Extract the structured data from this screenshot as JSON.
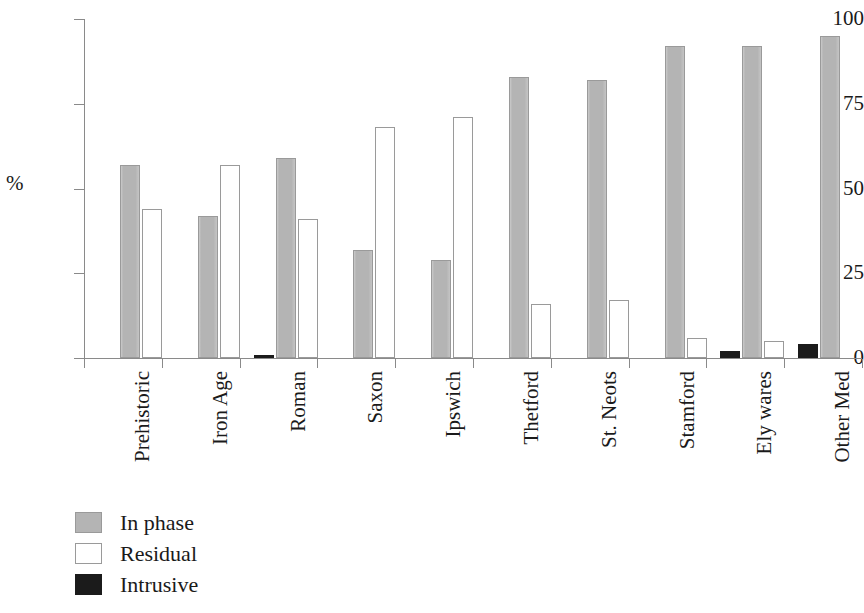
{
  "chart_data": {
    "type": "bar",
    "title": "",
    "xlabel": "",
    "ylabel": "%",
    "ylim": [
      0,
      100
    ],
    "yticks": [
      0,
      25,
      50,
      75,
      100
    ],
    "ytick_labels": [
      "0",
      "25",
      "50",
      "75",
      "100"
    ],
    "grid": false,
    "legend_position": "bottom-left",
    "orientation": "vertical",
    "grouping": "grouped",
    "xtick_label_rotation": 90,
    "categories": [
      "Prehistoric",
      "Iron Age",
      "Roman",
      "Saxon",
      "Ipswich",
      "Thetford",
      "St. Neots",
      "Stamford",
      "Ely wares",
      "Other Med"
    ],
    "series": [
      {
        "name": "In phase",
        "color": "#b4b4b4",
        "values": [
          57,
          42,
          59,
          32,
          29,
          83,
          82,
          92,
          92,
          95
        ]
      },
      {
        "name": "Residual",
        "color": "#ffffff",
        "values": [
          44,
          57,
          41,
          68,
          71,
          16,
          17,
          6,
          5,
          0
        ]
      },
      {
        "name": "Intrusive",
        "color": "#1b1b1b",
        "values": [
          0,
          0,
          1,
          0,
          0,
          0,
          0,
          0,
          2,
          4
        ]
      }
    ]
  },
  "legend": {
    "items": [
      {
        "label": "In phase",
        "swatch": "inphase"
      },
      {
        "label": "Residual",
        "swatch": "residual"
      },
      {
        "label": "Intrusive",
        "swatch": "intrusive"
      }
    ]
  },
  "axis": {
    "y_title": "%",
    "tick_0": "0",
    "tick_25": "25",
    "tick_50": "50",
    "tick_75": "75",
    "tick_100": "100"
  },
  "categories_text": {
    "c0": "Prehistoric",
    "c1": "Iron Age",
    "c2": "Roman",
    "c3": "Saxon",
    "c4": "Ipswich",
    "c5": "Thetford",
    "c6": "St. Neots",
    "c7": "Stamford",
    "c8": "Ely wares",
    "c9": "Other Med"
  }
}
